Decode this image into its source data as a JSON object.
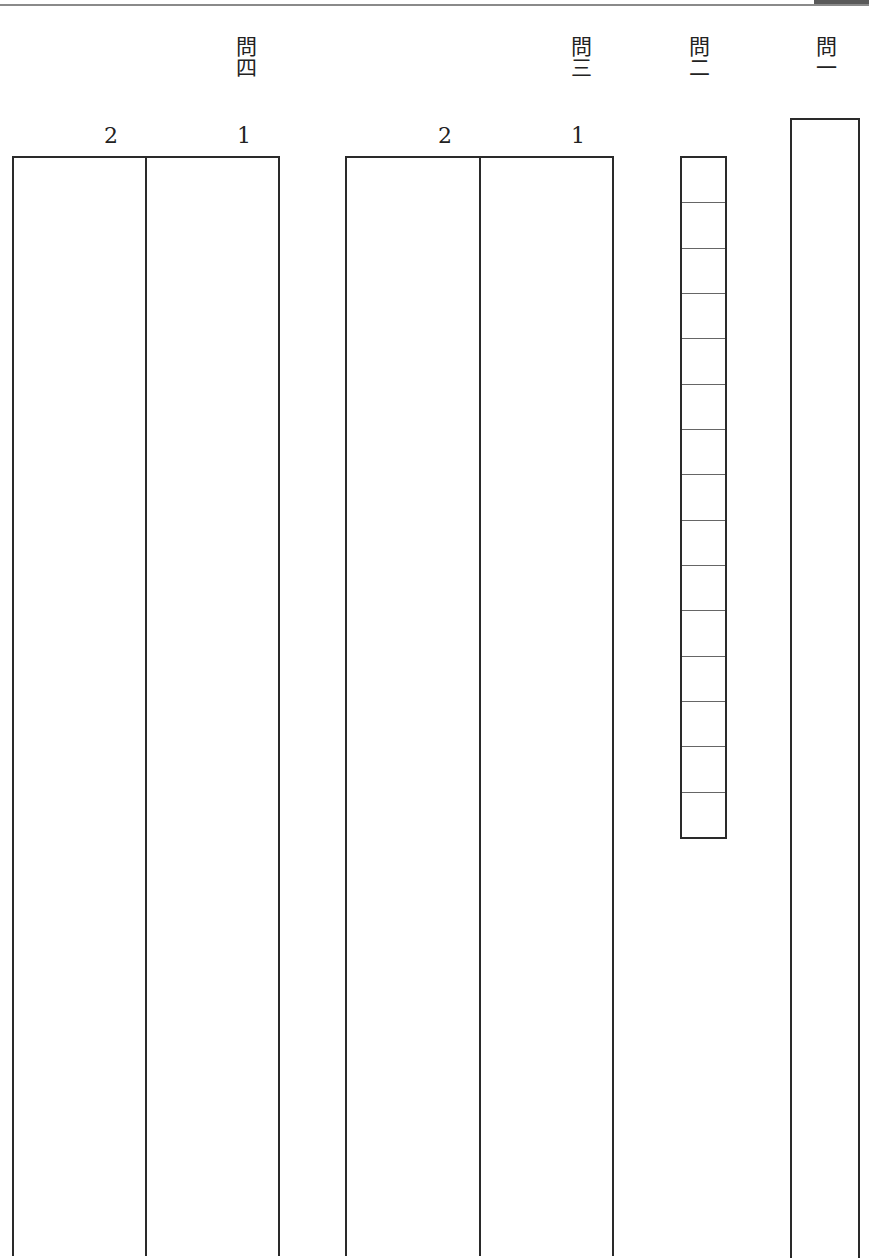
{
  "document": {
    "type": "answer-sheet",
    "orientation": "vertical-writing"
  },
  "questions": [
    {
      "id": "q1",
      "label": "問一",
      "answer_type": "single-column"
    },
    {
      "id": "q2",
      "label": "問二",
      "answer_type": "character-grid",
      "cell_count": 15
    },
    {
      "id": "q3",
      "label": "問三",
      "answer_type": "two-columns",
      "sub_labels": [
        "1",
        "2"
      ]
    },
    {
      "id": "q4",
      "label": "問四",
      "answer_type": "two-columns",
      "sub_labels": [
        "1",
        "2"
      ]
    }
  ],
  "colors": {
    "line": "#2a2a2a",
    "grid_line": "#666666",
    "top_rule": "#8a8a8a"
  }
}
